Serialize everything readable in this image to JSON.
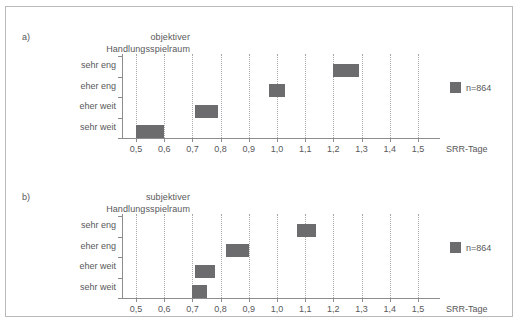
{
  "figure": {
    "background": "#ffffff",
    "bar_color": "#6c6c6e",
    "grid_color": "#a8a8aa",
    "axis_color": "#8d8d8f",
    "text_color": "#58585a"
  },
  "chart_data": [
    {
      "type": "bar",
      "orientation": "horizontal",
      "panel_tag": "a)",
      "title_line1": "objektiver",
      "title_line2": "Handlungsspielraum",
      "title": "a) objektiver Handlungsspielraum",
      "xlabel": "SRR-Tage",
      "ylabel": "",
      "xlim": [
        0.45,
        1.55
      ],
      "xticks": [
        0.5,
        0.6,
        0.7,
        0.8,
        0.9,
        1.0,
        1.1,
        1.2,
        1.3,
        1.4,
        1.5
      ],
      "xticklabels": [
        "0,5",
        "0,6",
        "0,7",
        "0,8",
        "0,9",
        "1,0",
        "1,1",
        "1,2",
        "1,3",
        "1,4",
        "1,5"
      ],
      "categories": [
        "sehr eng",
        "eher eng",
        "eher weit",
        "sehr weit"
      ],
      "grid": "vertical-dotted",
      "legend": {
        "position": "right",
        "label": "n=864"
      },
      "intervals": [
        {
          "category": "sehr eng",
          "low": 1.2,
          "high": 1.29
        },
        {
          "category": "eher eng",
          "low": 0.97,
          "high": 1.03
        },
        {
          "category": "eher weit",
          "low": 0.71,
          "high": 0.79
        },
        {
          "category": "sehr weit",
          "low": 0.5,
          "high": 0.6
        }
      ]
    },
    {
      "type": "bar",
      "orientation": "horizontal",
      "panel_tag": "b)",
      "title_line1": "subjektiver",
      "title_line2": "Handlungsspielraum",
      "title": "b) subjektiver Handlungsspielraum",
      "xlabel": "SRR-Tage",
      "ylabel": "",
      "xlim": [
        0.45,
        1.55
      ],
      "xticks": [
        0.5,
        0.6,
        0.7,
        0.8,
        0.9,
        1.0,
        1.1,
        1.2,
        1.3,
        1.4,
        1.5
      ],
      "xticklabels": [
        "0,5",
        "0,6",
        "0,7",
        "0,8",
        "0,9",
        "1,0",
        "1,1",
        "1,2",
        "1,3",
        "1,4",
        "1,5"
      ],
      "categories": [
        "sehr eng",
        "eher eng",
        "eher weit",
        "sehr weit"
      ],
      "grid": "vertical-dotted",
      "legend": {
        "position": "right",
        "label": "n=864"
      },
      "intervals": [
        {
          "category": "sehr eng",
          "low": 1.07,
          "high": 1.14
        },
        {
          "category": "eher eng",
          "low": 0.82,
          "high": 0.9
        },
        {
          "category": "eher weit",
          "low": 0.71,
          "high": 0.78
        },
        {
          "category": "sehr weit",
          "low": 0.7,
          "high": 0.75
        }
      ]
    }
  ]
}
